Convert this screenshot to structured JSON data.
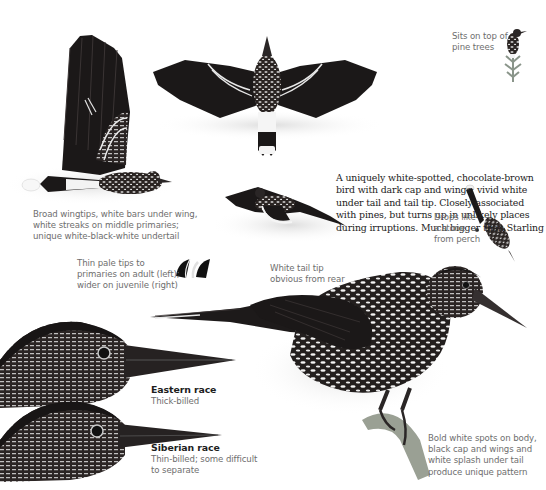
{
  "page": {
    "background": "#ffffff",
    "ink_color": "#1a1a1a",
    "caption_color": "#6e6e6e"
  },
  "main_description": "A uniquely white-spotted, chocolate-brown bird with dark cap and wings; vivid white under tail and tail tip. Closely associated with pines, but turns up in unlikely places during irruptions. Much bigger than Starling",
  "captions": {
    "perching_top": [
      "Sits on top of",
      "pine trees"
    ],
    "flight_side": [
      "Broad wingtips, white bars under wing,",
      "white streaks on middle primaries;",
      "unique white-black-white undertail"
    ],
    "primary_tips": [
      "Thin pale tips to",
      "primaries on adult (left);",
      "wider on juvenile (right)"
    ],
    "flight_rear": [
      "White tail tip",
      "obvious from rear"
    ],
    "dropping": [
      "Drops like",
      "a stone",
      "from perch"
    ],
    "perched_main": [
      "Bold white spots on body,",
      "black cap and wings and",
      "white splash under tail",
      "produce unique pattern"
    ]
  },
  "races": [
    {
      "title": "Eastern race",
      "subtitle": [
        "Thick-billed"
      ]
    },
    {
      "title": "Siberian race",
      "subtitle": [
        "Thin-billed; some difficult",
        "to separate"
      ]
    }
  ],
  "illustrations": [
    "flying-bird-side-view-icon",
    "flying-bird-from-above-icon",
    "bird-on-pine-top-icon",
    "flying-bird-from-rear-icon",
    "diving-bird-icon",
    "wingtip-adult-icon",
    "wingtip-juvenile-icon",
    "perched-bird-main-icon",
    "eastern-race-head-icon",
    "siberian-race-head-icon"
  ]
}
